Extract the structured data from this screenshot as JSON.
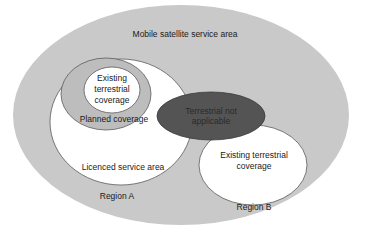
{
  "diagram": {
    "colors": {
      "background": "#ffffff",
      "outer_area": "#c9c9c9",
      "white_area": "#ffffff",
      "planned_area": "#bdbdbd",
      "not_applicable_area": "#545454",
      "stroke": "#5a5a5a"
    },
    "labels": {
      "mobile_satellite_service_area": "Mobile satellite service area",
      "existing_terrestrial_a_line1": "Existing",
      "existing_terrestrial_a_line2": "terrestrial",
      "existing_terrestrial_a_line3": "coverage",
      "planned_coverage": "Planned coverage",
      "terrestrial_not_applicable_line1": "Terrestrial not",
      "terrestrial_not_applicable_line2": "applicable",
      "licenced_service_area": "Licenced service area",
      "region_a": "Region A",
      "existing_terrestrial_b_line1": "Existing terrestrial",
      "existing_terrestrial_b_line2": "coverage",
      "region_b": "Region B"
    }
  }
}
